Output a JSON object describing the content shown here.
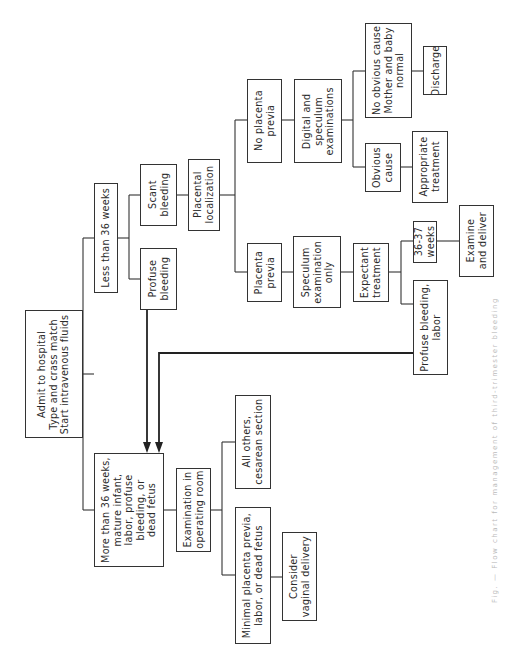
{
  "diagram": {
    "type": "flowchart",
    "orientation": "rotated-90-ccw",
    "nodes": {
      "admit": "Admit to hospital\nType and crass match\nStart intravenous fluids",
      "less_36": "Less than 36 weeks",
      "more_36": "More than 36 weeks,\nmature infant,\nlabor, profuse\nbleeding, or\ndead fetus",
      "scant": "Scant\nbleeding",
      "profuse": "Profuse\nbleeding",
      "placental_loc": "Placental\nlocalization",
      "no_previa": "No placenta\nprevia",
      "previa": "Placenta\nprevia",
      "digital_spec": "Digital and\nspeculum\nexaminations",
      "spec_only": "Speculum\nexamination\nonly",
      "no_obvious": "No obvious cause\nMother and baby\nnormal",
      "discharge": "Discharge",
      "obvious": "Obvious\ncause",
      "appropriate": "Appropriate\ntreatment",
      "expectant": "Expectant\ntreatment",
      "wk_36_37": "36-37\nweeks",
      "examine_deliver": "Examine\nand deliver",
      "profuse_labor": "Profuse bleeding,\nlabor",
      "exam_or": "Examination in\noperating room",
      "all_others": "All others,\ncesarean section",
      "minimal": "Minimal placenta previa,\nlabor, or dead fetus",
      "vaginal": "Consider\nvaginal delivery"
    },
    "edges": [
      [
        "admit",
        "less_36"
      ],
      [
        "admit",
        "more_36"
      ],
      [
        "less_36",
        "scant"
      ],
      [
        "less_36",
        "profuse"
      ],
      [
        "scant",
        "placental_loc"
      ],
      [
        "placental_loc",
        "no_previa"
      ],
      [
        "placental_loc",
        "previa"
      ],
      [
        "no_previa",
        "digital_spec"
      ],
      [
        "digital_spec",
        "no_obvious"
      ],
      [
        "digital_spec",
        "obvious"
      ],
      [
        "no_obvious",
        "discharge"
      ],
      [
        "obvious",
        "appropriate"
      ],
      [
        "previa",
        "spec_only"
      ],
      [
        "spec_only",
        "expectant"
      ],
      [
        "expectant",
        "wk_36_37"
      ],
      [
        "expectant",
        "profuse_labor"
      ],
      [
        "wk_36_37",
        "examine_deliver"
      ],
      [
        "profuse",
        "more_36"
      ],
      [
        "profuse_labor",
        "more_36"
      ],
      [
        "more_36",
        "exam_or"
      ],
      [
        "exam_or",
        "all_others"
      ],
      [
        "exam_or",
        "minimal"
      ],
      [
        "minimal",
        "vaginal"
      ]
    ],
    "caption": "Fig. — Flow chart for management of third-trimester bleeding",
    "line_color": "#333333"
  }
}
